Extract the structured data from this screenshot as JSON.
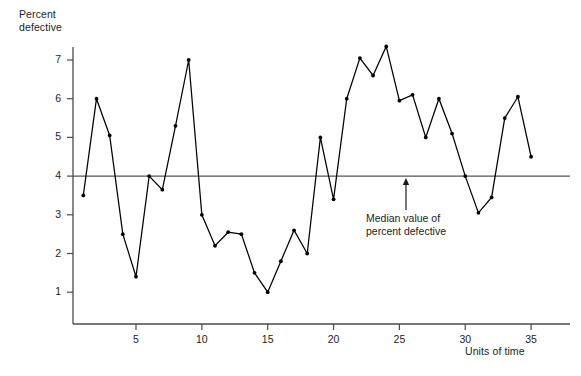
{
  "chart_data": {
    "type": "line",
    "title": "",
    "xlabel": "Units of time",
    "ylabel": "Percent defective",
    "ylabel_lines": [
      "Percent",
      "defective"
    ],
    "xlim": [
      0,
      36
    ],
    "ylim": [
      0,
      7.8
    ],
    "grid": false,
    "legend": null,
    "marker": "filled-circle",
    "line_color": "#000000",
    "x": [
      1,
      2,
      3,
      4,
      5,
      6,
      7,
      8,
      9,
      10,
      11,
      12,
      13,
      14,
      15,
      16,
      17,
      18,
      19,
      20,
      21,
      22,
      23,
      24,
      25,
      26,
      27,
      28,
      29,
      30,
      31,
      32,
      33,
      34,
      35
    ],
    "values": [
      3.5,
      6.0,
      5.05,
      2.5,
      1.4,
      4.0,
      3.65,
      5.3,
      7.0,
      3.0,
      2.2,
      2.55,
      2.5,
      1.5,
      1.0,
      1.8,
      2.6,
      2.0,
      5.0,
      3.4,
      6.0,
      7.05,
      6.6,
      7.35,
      5.95,
      6.1,
      5.0,
      6.0,
      5.1,
      4.0,
      3.05,
      3.45,
      5.5,
      6.05,
      4.5
    ],
    "y_ticks": [
      1,
      2,
      3,
      4,
      5,
      6,
      7
    ],
    "x_ticks": [
      5,
      10,
      15,
      20,
      25,
      30,
      35
    ],
    "reference_line": {
      "value": 4,
      "color": "#555555",
      "label_lines": [
        "Median value of",
        "percent defective"
      ]
    },
    "annotation": {
      "text_lines": [
        "Median value of",
        "percent defective"
      ],
      "arrow_at_x": 25.5,
      "arrow_points_to": 4
    }
  }
}
